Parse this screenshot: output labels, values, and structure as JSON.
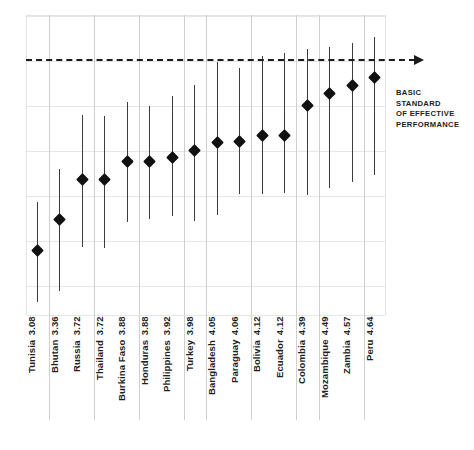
{
  "chart_data": {
    "type": "scatter",
    "title": "",
    "subtitle": "",
    "xlabel": "",
    "ylabel": "",
    "ylim": [
      2.5,
      5.2
    ],
    "grid": true,
    "legend": null,
    "annotations": [
      {
        "name": "basic-standard-line",
        "text_lines": [
          "BASIC",
          "STANDARD",
          "OF EFFECTIVE",
          "PERFORMANCE"
        ],
        "value": 4.8,
        "style": "dashed-horizontal-with-arrow"
      }
    ],
    "categories": [
      "Tunisia",
      "Bhutan",
      "Russia",
      "Thailand",
      "Burkina Faso",
      "Honduras",
      "Philippines",
      "Turkey",
      "Bangladesh",
      "Paraguay",
      "Bolivia",
      "Ecuador",
      "Colombia",
      "Mozambique",
      "Zambia",
      "Peru"
    ],
    "values": [
      3.08,
      3.36,
      3.72,
      3.72,
      3.88,
      3.88,
      3.92,
      3.98,
      4.05,
      4.06,
      4.12,
      4.12,
      4.39,
      4.49,
      4.57,
      4.64
    ],
    "error_low": [
      2.62,
      2.72,
      3.11,
      3.1,
      3.34,
      3.36,
      3.39,
      3.35,
      3.4,
      3.59,
      3.59,
      3.6,
      3.58,
      3.64,
      3.7,
      3.76
    ],
    "error_high": [
      3.52,
      3.81,
      4.3,
      4.29,
      4.42,
      4.38,
      4.47,
      4.57,
      4.78,
      4.72,
      4.83,
      4.86,
      4.89,
      4.91,
      4.95,
      5.0
    ],
    "points": [
      {
        "label": "Tunisia",
        "value": "3.08",
        "low": 2.62,
        "high": 3.52
      },
      {
        "label": "Bhutan",
        "value": "3.36",
        "low": 2.72,
        "high": 3.81
      },
      {
        "label": "Russia",
        "value": "3.72",
        "low": 3.11,
        "high": 4.3
      },
      {
        "label": "Thailand",
        "value": "3.72",
        "low": 3.1,
        "high": 4.29
      },
      {
        "label": "Burkina Faso",
        "value": "3.88",
        "low": 3.34,
        "high": 4.42
      },
      {
        "label": "Honduras",
        "value": "3.88",
        "low": 3.36,
        "high": 4.38
      },
      {
        "label": "Philippines",
        "value": "3.92",
        "low": 3.39,
        "high": 4.47
      },
      {
        "label": "Turkey",
        "value": "3.98",
        "low": 3.35,
        "high": 4.57
      },
      {
        "label": "Bangladesh",
        "value": "4.05",
        "low": 3.4,
        "high": 4.78
      },
      {
        "label": "Paraguay",
        "value": "4.06",
        "low": 3.59,
        "high": 4.72
      },
      {
        "label": "Bolivia",
        "value": "4.12",
        "low": 3.59,
        "high": 4.83
      },
      {
        "label": "Ecuador",
        "value": "4.12",
        "low": 3.6,
        "high": 4.86
      },
      {
        "label": "Colombia",
        "value": "4.39",
        "low": 3.58,
        "high": 4.89
      },
      {
        "label": "Mozambique",
        "value": "4.49",
        "low": 3.64,
        "high": 4.91
      },
      {
        "label": "Zambia",
        "value": "4.57",
        "low": 3.7,
        "high": 4.95
      },
      {
        "label": "Peru",
        "value": "4.64",
        "low": 3.76,
        "high": 5.0
      }
    ],
    "colors": {
      "marker": "#111111",
      "whisker": "#3b3b3b",
      "gridline": "#e6e6e6",
      "column_separator": "#cfcfcf",
      "reference_line": "#1b1b1b",
      "background": "#ffffff",
      "text": "#1f1f1f"
    },
    "gridline_values": [
      5.2,
      4.8,
      4.4,
      4.0,
      3.6,
      3.2,
      2.8
    ],
    "column_separator_indices": [
      0,
      2,
      4,
      6,
      7,
      9,
      11,
      12,
      14
    ]
  }
}
